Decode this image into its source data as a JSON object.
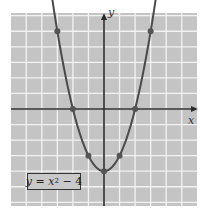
{
  "chart_data": {
    "type": "line",
    "title": "",
    "equation_label": "y = x^2 - 4",
    "equation_parts": {
      "lhs": "y",
      "eq": " = ",
      "var": "x",
      "exp": "2",
      "rest": " − 4"
    },
    "xlabel": "x",
    "ylabel": "y",
    "xlim": [
      -6,
      6
    ],
    "ylim": [
      -6,
      6
    ],
    "grid": true,
    "series": [
      {
        "name": "y = x^2 - 4",
        "function": "x^2 - 4",
        "plotted_points": [
          {
            "x": -3,
            "y": 5
          },
          {
            "x": -2,
            "y": 0
          },
          {
            "x": -1,
            "y": -3
          },
          {
            "x": 0,
            "y": -4
          },
          {
            "x": 1,
            "y": -3
          },
          {
            "x": 2,
            "y": 0
          },
          {
            "x": 3,
            "y": 5
          }
        ]
      }
    ]
  },
  "colors": {
    "grid_background": "#c4c4c4",
    "grid_lines": "#f2f2f2",
    "axis": "#2a2a2a",
    "curve": "#4a4a4a",
    "points": "#555555"
  }
}
